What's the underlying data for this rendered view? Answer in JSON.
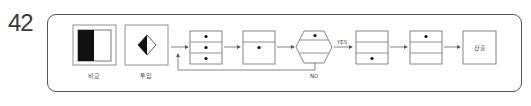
{
  "question_number": "42",
  "legend": [
    {
      "id": "compare",
      "label": "비교",
      "icon": "half-black-square-icon"
    },
    {
      "id": "input",
      "label": "투입",
      "icon": "half-black-diamond-icon"
    }
  ],
  "flow": {
    "nodes": [
      {
        "id": "box1",
        "shape": "three-row-box",
        "dots": [
          true,
          true,
          true
        ]
      },
      {
        "id": "box2",
        "shape": "two-row-box",
        "dots": [
          false,
          true
        ]
      },
      {
        "id": "decision",
        "shape": "hexagon",
        "dots": [
          true,
          false
        ]
      },
      {
        "id": "box3",
        "shape": "three-row-box",
        "dots": [
          false,
          false,
          true
        ]
      },
      {
        "id": "box4",
        "shape": "three-row-box",
        "dots": [
          true,
          false,
          false
        ]
      },
      {
        "id": "output",
        "shape": "square",
        "label": "산출"
      }
    ],
    "edges": [
      {
        "from": "start",
        "to": "box1"
      },
      {
        "from": "box1",
        "to": "box2"
      },
      {
        "from": "box2",
        "to": "decision"
      },
      {
        "from": "decision",
        "to": "box3",
        "label": "YES"
      },
      {
        "from": "decision",
        "to": "box1",
        "label": "NO"
      },
      {
        "from": "box3",
        "to": "box4"
      },
      {
        "from": "box4",
        "to": "output"
      }
    ],
    "yes_label": "YES",
    "no_label": "NO",
    "output_label": "산출"
  }
}
